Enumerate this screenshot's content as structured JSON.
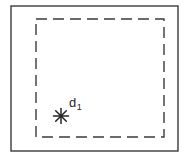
{
  "figure": {
    "kind": "technical-line-diagram",
    "background_color": "#ffffff",
    "stroke_color": "#3b3b3b",
    "label_color": "#262626",
    "outer_boundary": {
      "name": "solid outer rectangle",
      "style": "solid",
      "x": 11,
      "y": 6,
      "width": 167,
      "height": 145,
      "stroke_width": 1.4
    },
    "inner_boundary": {
      "name": "dashed inner rectangle",
      "style": "dashed",
      "x": 36,
      "y": 19,
      "width": 128,
      "height": 118,
      "stroke_width": 1.4,
      "dash_pattern": "11 6"
    },
    "marker": {
      "name": "star marker",
      "glyph": "asterisk-star",
      "rays": 8,
      "x": 61,
      "y": 116,
      "radius": 7.5,
      "stroke_width": 1.5
    },
    "annotation": {
      "base": "d",
      "subscript": "1",
      "full_text": "d1",
      "x": 70,
      "y": 97
    }
  }
}
